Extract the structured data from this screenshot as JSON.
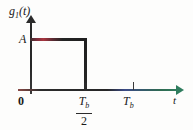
{
  "figure": {
    "kind": "rectangular-pulse-plot",
    "background_color": "#fdfdfc",
    "line_color": "#2b2b2b",
    "axis_arrow_color": "#2f7d5e",
    "pulse_highlight_color": "#a8353f"
  },
  "labels": {
    "y_axis_function": "g",
    "y_axis_subscript": "1",
    "y_axis_argument": "(t)",
    "amplitude": "A",
    "origin": "0",
    "x_axis_variable": "t",
    "tick_tb_symbol": "T",
    "tick_tb_subscript": "b",
    "frac_numerator_symbol": "T",
    "frac_numerator_subscript": "b",
    "frac_denominator": "2"
  },
  "chart_data": {
    "type": "line",
    "title": "",
    "xlabel": "t",
    "ylabel": "g1(t)",
    "xlim": [
      0,
      1.3
    ],
    "ylim": [
      0,
      1.25
    ],
    "grid": false,
    "legend": null,
    "xticks": [
      0,
      0.5,
      1.0
    ],
    "xticklabels": [
      "0",
      "Tb/2",
      "Tb"
    ],
    "yticks": [
      1.0
    ],
    "yticklabels": [
      "A"
    ],
    "series": [
      {
        "name": "g1(t)",
        "x": [
          0,
          0,
          0.5,
          0.5,
          1.3
        ],
        "values": [
          0,
          1.0,
          1.0,
          0,
          0
        ],
        "description": "Rectangular pulse of amplitude A on 0 <= t < Tb/2, zero elsewhere"
      }
    ],
    "annotations": [
      {
        "text": "A",
        "x": 0,
        "y": 1.0,
        "position": "left-of-axis"
      },
      {
        "text": "Tb/2",
        "x": 0.5,
        "y": 0,
        "position": "below-axis"
      },
      {
        "text": "Tb",
        "x": 1.0,
        "y": 0,
        "position": "below-axis"
      },
      {
        "text": "0",
        "x": 0,
        "y": 0,
        "position": "below-left-of-origin"
      }
    ]
  }
}
